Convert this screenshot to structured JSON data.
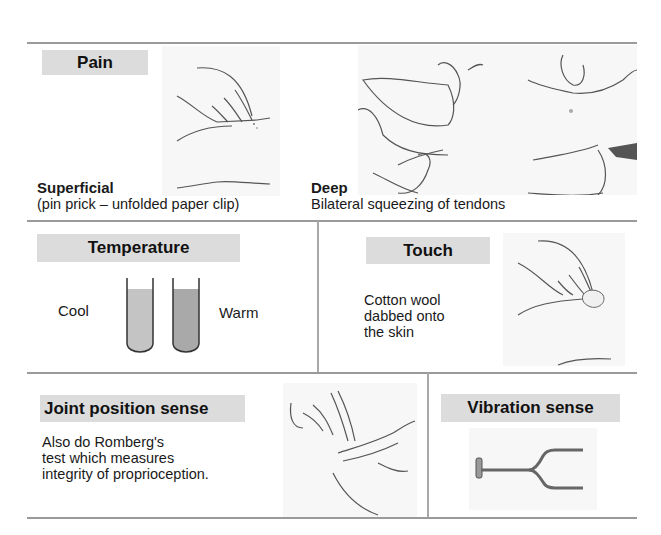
{
  "sections": {
    "pain": {
      "title": "Pain",
      "superficial": {
        "heading": "Superficial",
        "description": "(pin prick – unfolded paper clip)",
        "illustration": "hand-pin-prick-illustration"
      },
      "deep": {
        "heading": "Deep",
        "description": "Bilateral squeezing of tendons",
        "illustration": "tendon-squeeze-illustration"
      }
    },
    "temperature": {
      "title": "Temperature",
      "left_label": "Cool",
      "right_label": "Warm",
      "illustration": "test-tubes-illustration",
      "colors": {
        "cool": "#c4c4c4",
        "warm": "#a9a9a9"
      }
    },
    "touch": {
      "title": "Touch",
      "description_lines": [
        "Cotton wool",
        "dabbed onto",
        "the skin"
      ],
      "illustration": "cotton-wool-illustration"
    },
    "joint_position": {
      "title": "Joint position sense",
      "description_lines": [
        "Also do Romberg's",
        "test which measures",
        "integrity of proprioception."
      ],
      "illustration": "finger-joint-illustration"
    },
    "vibration": {
      "title": "Vibration sense",
      "illustration": "tuning-fork-illustration"
    }
  },
  "colors": {
    "label_bg": "#dcdcdc",
    "rule": "#9a9a9a",
    "image_bg": "#f7f7f7"
  }
}
